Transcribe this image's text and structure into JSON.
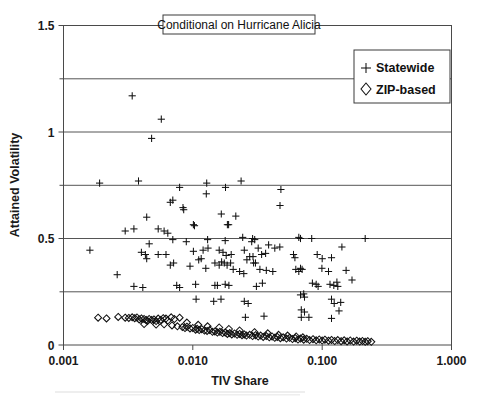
{
  "figure": {
    "title": "Conditional on Hurricane Alicia",
    "background_color": "#ffffff",
    "frame_color": "#4a4a4a",
    "grid_color": "#555555",
    "marker_color": "#111111"
  },
  "legend": {
    "position": "top-right",
    "entries": [
      {
        "label": "Statewide",
        "marker": "plus-icon"
      },
      {
        "label": "ZIP-based",
        "marker": "diamond-icon"
      }
    ]
  },
  "axes": {
    "x": {
      "label": "TIV Share",
      "scale": "log",
      "min": 0.001,
      "max": 1.0,
      "ticks": [
        "0.001",
        "0.010",
        "0.100",
        "1.000"
      ],
      "tick_values": [
        0.001,
        0.01,
        0.1,
        1.0
      ]
    },
    "y": {
      "label": "Attained Volatility",
      "scale": "linear",
      "min": 0,
      "max": 1.5,
      "ticks": [
        "0",
        "0.5",
        "1",
        "1.5"
      ],
      "tick_values": [
        0,
        0.5,
        1,
        1.5
      ],
      "gridlines": [
        0.25,
        0.5,
        0.75,
        1.0,
        1.25
      ]
    }
  },
  "chart_data": {
    "type": "scatter",
    "title": "Conditional on Hurricane Alicia",
    "xlabel": "TIV Share",
    "ylabel": "Attained Volatility",
    "xscale": "log",
    "xlim": [
      0.001,
      1.0
    ],
    "ylim": [
      0,
      1.5
    ],
    "grid": true,
    "legend_position": "top-right",
    "series": [
      {
        "name": "Statewide",
        "marker": "plus",
        "points": [
          [
            0.0034,
            1.17
          ],
          [
            0.0057,
            1.06
          ],
          [
            0.0048,
            0.97
          ],
          [
            0.0019,
            0.76
          ],
          [
            0.0038,
            0.77
          ],
          [
            0.0079,
            0.74
          ],
          [
            0.0128,
            0.76
          ],
          [
            0.0127,
            0.71
          ],
          [
            0.0179,
            0.74
          ],
          [
            0.0236,
            0.77
          ],
          [
            0.048,
            0.73
          ],
          [
            0.0067,
            0.67
          ],
          [
            0.007,
            0.68
          ],
          [
            0.0084,
            0.645
          ],
          [
            0.0085,
            0.635
          ],
          [
            0.0472,
            0.655
          ],
          [
            0.0044,
            0.6
          ],
          [
            0.0166,
            0.615
          ],
          [
            0.0215,
            0.605
          ],
          [
            0.003,
            0.535
          ],
          [
            0.0035,
            0.545
          ],
          [
            0.0054,
            0.545
          ],
          [
            0.006,
            0.535
          ],
          [
            0.0064,
            0.525
          ],
          [
            0.0101,
            0.565
          ],
          [
            0.0103,
            0.56
          ],
          [
            0.0185,
            0.565
          ],
          [
            0.0189,
            0.565
          ],
          [
            0.007,
            0.495
          ],
          [
            0.0089,
            0.485
          ],
          [
            0.013,
            0.495
          ],
          [
            0.0178,
            0.49
          ],
          [
            0.0243,
            0.505
          ],
          [
            0.029,
            0.5
          ],
          [
            0.0301,
            0.495
          ],
          [
            0.066,
            0.505
          ],
          [
            0.068,
            0.5
          ],
          [
            0.083,
            0.5
          ],
          [
            0.215,
            0.5
          ],
          [
            0.0016,
            0.445
          ],
          [
            0.0046,
            0.475
          ],
          [
            0.0285,
            0.485
          ],
          [
            0.032,
            0.455
          ],
          [
            0.0385,
            0.47
          ],
          [
            0.043,
            0.455
          ],
          [
            0.047,
            0.46
          ],
          [
            0.142,
            0.46
          ],
          [
            0.004,
            0.435
          ],
          [
            0.0043,
            0.425
          ],
          [
            0.0044,
            0.405
          ],
          [
            0.0054,
            0.425
          ],
          [
            0.0062,
            0.425
          ],
          [
            0.0101,
            0.44
          ],
          [
            0.012,
            0.445
          ],
          [
            0.0131,
            0.455
          ],
          [
            0.016,
            0.445
          ],
          [
            0.0171,
            0.435
          ],
          [
            0.0181,
            0.42
          ],
          [
            0.0198,
            0.425
          ],
          [
            0.025,
            0.445
          ],
          [
            0.0262,
            0.4
          ],
          [
            0.0275,
            0.415
          ],
          [
            0.0292,
            0.415
          ],
          [
            0.034,
            0.425
          ],
          [
            0.0365,
            0.43
          ],
          [
            0.06,
            0.425
          ],
          [
            0.0615,
            0.41
          ],
          [
            0.0915,
            0.425
          ],
          [
            0.1,
            0.405
          ],
          [
            0.118,
            0.41
          ],
          [
            0.0067,
            0.375
          ],
          [
            0.0071,
            0.385
          ],
          [
            0.0095,
            0.37
          ],
          [
            0.0111,
            0.4
          ],
          [
            0.0116,
            0.405
          ],
          [
            0.0148,
            0.385
          ],
          [
            0.016,
            0.375
          ],
          [
            0.0167,
            0.39
          ],
          [
            0.0175,
            0.385
          ],
          [
            0.0184,
            0.375
          ],
          [
            0.0196,
            0.385
          ],
          [
            0.023,
            0.345
          ],
          [
            0.0295,
            0.385
          ],
          [
            0.0305,
            0.385
          ],
          [
            0.033,
            0.355
          ],
          [
            0.037,
            0.35
          ],
          [
            0.0415,
            0.345
          ],
          [
            0.0625,
            0.355
          ],
          [
            0.066,
            0.345
          ],
          [
            0.068,
            0.36
          ],
          [
            0.07,
            0.355
          ],
          [
            0.0995,
            0.36
          ],
          [
            0.112,
            0.345
          ],
          [
            0.153,
            0.35
          ],
          [
            0.0026,
            0.33
          ],
          [
            0.0126,
            0.36
          ],
          [
            0.0205,
            0.355
          ],
          [
            0.0248,
            0.335
          ],
          [
            0.0035,
            0.275
          ],
          [
            0.0041,
            0.27
          ],
          [
            0.0075,
            0.28
          ],
          [
            0.0079,
            0.27
          ],
          [
            0.0105,
            0.285
          ],
          [
            0.0148,
            0.28
          ],
          [
            0.0155,
            0.28
          ],
          [
            0.0178,
            0.285
          ],
          [
            0.019,
            0.28
          ],
          [
            0.031,
            0.275
          ],
          [
            0.0345,
            0.29
          ],
          [
            0.084,
            0.29
          ],
          [
            0.09,
            0.285
          ],
          [
            0.093,
            0.275
          ],
          [
            0.115,
            0.285
          ],
          [
            0.123,
            0.28
          ],
          [
            0.13,
            0.295
          ],
          [
            0.132,
            0.275
          ],
          [
            0.17,
            0.305
          ],
          [
            0.0106,
            0.215
          ],
          [
            0.0145,
            0.205
          ],
          [
            0.0165,
            0.215
          ],
          [
            0.025,
            0.205
          ],
          [
            0.0268,
            0.195
          ],
          [
            0.068,
            0.235
          ],
          [
            0.072,
            0.24
          ],
          [
            0.073,
            0.225
          ],
          [
            0.118,
            0.215
          ],
          [
            0.124,
            0.195
          ],
          [
            0.139,
            0.2
          ],
          [
            0.069,
            0.165
          ],
          [
            0.073,
            0.155
          ],
          [
            0.135,
            0.16
          ],
          [
            0.0255,
            0.13
          ],
          [
            0.0355,
            0.135
          ],
          [
            0.069,
            0.13
          ],
          [
            0.079,
            0.13
          ],
          [
            0.118,
            0.125
          ]
        ]
      },
      {
        "name": "ZIP-based",
        "marker": "diamond",
        "points": [
          [
            0.00185,
            0.128
          ],
          [
            0.00215,
            0.125
          ],
          [
            0.00265,
            0.132
          ],
          [
            0.003,
            0.128
          ],
          [
            0.0032,
            0.127
          ],
          [
            0.0034,
            0.13
          ],
          [
            0.00355,
            0.126
          ],
          [
            0.0037,
            0.129
          ],
          [
            0.00385,
            0.12
          ],
          [
            0.004,
            0.125
          ],
          [
            0.0042,
            0.122
          ],
          [
            0.00435,
            0.118
          ],
          [
            0.00445,
            0.113
          ],
          [
            0.0046,
            0.122
          ],
          [
            0.0048,
            0.118
          ],
          [
            0.005,
            0.12
          ],
          [
            0.0052,
            0.112
          ],
          [
            0.0054,
            0.124
          ],
          [
            0.00565,
            0.118
          ],
          [
            0.0059,
            0.126
          ],
          [
            0.0062,
            0.124
          ],
          [
            0.0064,
            0.115
          ],
          [
            0.0068,
            0.13
          ],
          [
            0.0072,
            0.122
          ],
          [
            0.0079,
            0.128
          ],
          [
            0.0042,
            0.098
          ],
          [
            0.0052,
            0.096
          ],
          [
            0.006,
            0.097
          ],
          [
            0.0069,
            0.092
          ],
          [
            0.0076,
            0.088
          ],
          [
            0.0083,
            0.084
          ],
          [
            0.0087,
            0.08
          ],
          [
            0.009,
            0.086
          ],
          [
            0.0095,
            0.078
          ],
          [
            0.01,
            0.08
          ],
          [
            0.0105,
            0.072
          ],
          [
            0.0108,
            0.076
          ],
          [
            0.0112,
            0.07
          ],
          [
            0.0117,
            0.074
          ],
          [
            0.0123,
            0.068
          ],
          [
            0.0129,
            0.066
          ],
          [
            0.0135,
            0.07
          ],
          [
            0.0142,
            0.062
          ],
          [
            0.0148,
            0.064
          ],
          [
            0.0155,
            0.058
          ],
          [
            0.0162,
            0.062
          ],
          [
            0.017,
            0.056
          ],
          [
            0.0178,
            0.058
          ],
          [
            0.0185,
            0.052
          ],
          [
            0.0193,
            0.056
          ],
          [
            0.02,
            0.05
          ],
          [
            0.021,
            0.054
          ],
          [
            0.022,
            0.048
          ],
          [
            0.023,
            0.052
          ],
          [
            0.024,
            0.046
          ],
          [
            0.025,
            0.05
          ],
          [
            0.026,
            0.044
          ],
          [
            0.0275,
            0.048
          ],
          [
            0.029,
            0.042
          ],
          [
            0.0305,
            0.046
          ],
          [
            0.032,
            0.04
          ],
          [
            0.0335,
            0.044
          ],
          [
            0.035,
            0.038
          ],
          [
            0.037,
            0.042
          ],
          [
            0.039,
            0.036
          ],
          [
            0.041,
            0.04
          ],
          [
            0.043,
            0.034
          ],
          [
            0.045,
            0.038
          ],
          [
            0.0475,
            0.032
          ],
          [
            0.05,
            0.036
          ],
          [
            0.053,
            0.03
          ],
          [
            0.056,
            0.034
          ],
          [
            0.059,
            0.028
          ],
          [
            0.062,
            0.032
          ],
          [
            0.065,
            0.026
          ],
          [
            0.068,
            0.03
          ],
          [
            0.072,
            0.025
          ],
          [
            0.076,
            0.029
          ],
          [
            0.08,
            0.023
          ],
          [
            0.085,
            0.027
          ],
          [
            0.09,
            0.022
          ],
          [
            0.095,
            0.026
          ],
          [
            0.1,
            0.021
          ],
          [
            0.105,
            0.025
          ],
          [
            0.112,
            0.02
          ],
          [
            0.118,
            0.024
          ],
          [
            0.125,
            0.019
          ],
          [
            0.132,
            0.023
          ],
          [
            0.14,
            0.018
          ],
          [
            0.148,
            0.022
          ],
          [
            0.156,
            0.017
          ],
          [
            0.165,
            0.021
          ],
          [
            0.175,
            0.016
          ],
          [
            0.185,
            0.02
          ],
          [
            0.195,
            0.016
          ],
          [
            0.205,
            0.019
          ],
          [
            0.215,
            0.015
          ],
          [
            0.225,
            0.018
          ],
          [
            0.24,
            0.015
          ],
          [
            0.019,
            0.075
          ],
          [
            0.023,
            0.068
          ],
          [
            0.03,
            0.06
          ],
          [
            0.038,
            0.055
          ],
          [
            0.046,
            0.048
          ],
          [
            0.054,
            0.044
          ],
          [
            0.063,
            0.04
          ],
          [
            0.071,
            0.036
          ],
          [
            0.009,
            0.105
          ],
          [
            0.011,
            0.095
          ],
          [
            0.013,
            0.088
          ],
          [
            0.016,
            0.082
          ]
        ]
      }
    ]
  }
}
